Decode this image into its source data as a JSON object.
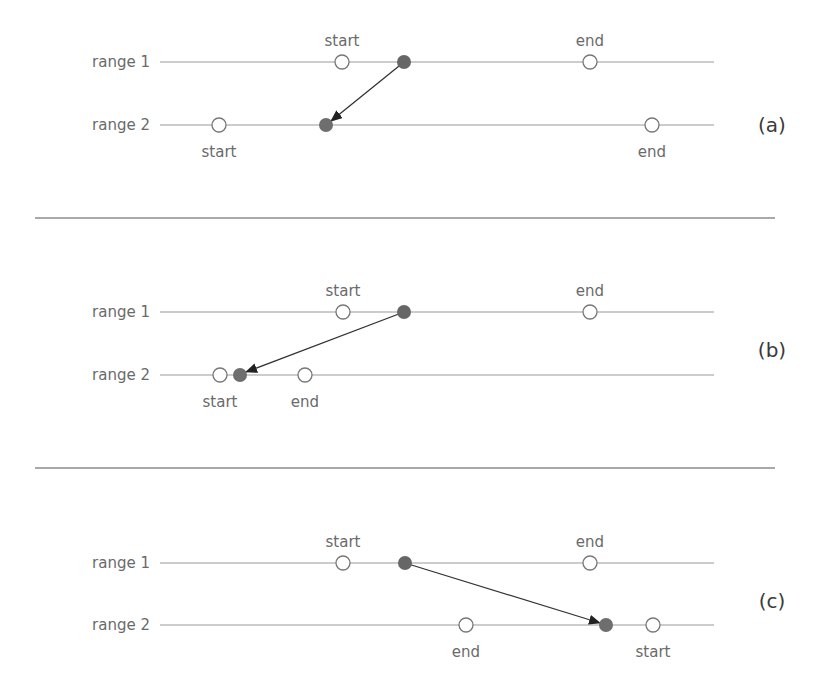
{
  "colors": {
    "line": "#9a9a9a",
    "divider": "#555555",
    "marker_filled": "#6a6a6a",
    "arrow": "#333333",
    "text": "#6a6a6a"
  },
  "panels": [
    {
      "tag": "(a)",
      "row1": {
        "label": "range 1",
        "start": {
          "x": 342,
          "text": "start"
        },
        "end": {
          "x": 590,
          "text": "end"
        },
        "point": 404
      },
      "row2": {
        "label": "range 2",
        "start": {
          "x": 219,
          "text": "start"
        },
        "end": {
          "x": 652,
          "text": "end"
        },
        "point": 326
      }
    },
    {
      "tag": "(b)",
      "row1": {
        "label": "range 1",
        "start": {
          "x": 343,
          "text": "start"
        },
        "end": {
          "x": 590,
          "text": "end"
        },
        "point": 404
      },
      "row2": {
        "label": "range 2",
        "start": {
          "x": 220,
          "text": "start"
        },
        "end": {
          "x": 305,
          "text": "end"
        },
        "point": 240
      }
    },
    {
      "tag": "(c)",
      "row1": {
        "label": "range 1",
        "start": {
          "x": 343,
          "text": "start"
        },
        "end": {
          "x": 590,
          "text": "end"
        },
        "point": 405
      },
      "row2": {
        "label": "range 2",
        "start": {
          "x": 653,
          "text": "start"
        },
        "end": {
          "x": 466,
          "text": "end"
        },
        "point": 606
      }
    }
  ]
}
